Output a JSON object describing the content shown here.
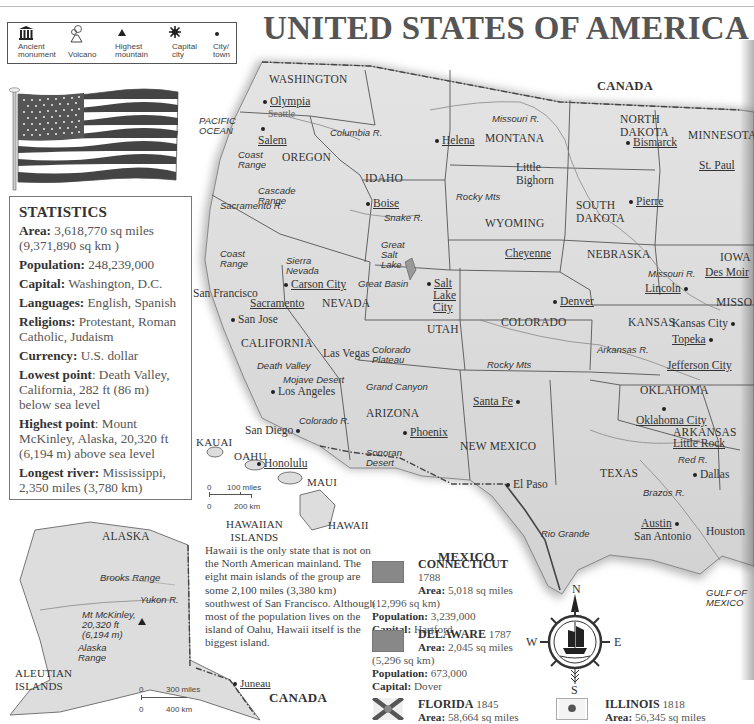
{
  "title": "UNITED STATES OF AMERICA",
  "legend": {
    "items": [
      {
        "icon": "ancient-monument-icon",
        "label": "Ancient monument"
      },
      {
        "icon": "volcano-icon",
        "label": "Volcano"
      },
      {
        "icon": "highest-mountain-icon",
        "label": "Highest mountain"
      },
      {
        "icon": "capital-city-icon",
        "label": "Capital city"
      },
      {
        "icon": "city-town-icon",
        "label": "City/ town"
      }
    ],
    "labels": {
      "monument_1": "Ancient",
      "monument_2": "monument",
      "volcano": "Volcano",
      "mountain_1": "Highest",
      "mountain_2": "mountain",
      "capital_1": "Capital",
      "capital_2": "city",
      "city_1": "City/",
      "city_2": "town"
    }
  },
  "statistics": {
    "heading": "STATISTICS",
    "area_label": "Area:",
    "area_value": "3,618,770 sq miles (9,371,890 sq km )",
    "population_label": "Population:",
    "population_value": "248,239,000",
    "capital_label": "Capital:",
    "capital_value": "Washington, D.C.",
    "languages_label": "Languages:",
    "languages_value": "English, Spanish",
    "religions_label": "Religions:",
    "religions_value": "Protestant, Roman Catholic, Judaism",
    "currency_label": "Currency:",
    "currency_value": "U.S. dollar",
    "lowest_label": "Lowest point",
    "lowest_value": ": Death Valley, California, 282 ft (86 m) below sea level",
    "highest_label": "Highest point",
    "highest_value": ": Mount McKinley, Alaska, 20,320 ft (6,194 m) above sea level",
    "river_label": "Longest river:",
    "river_value": "Mississippi, 2,350 miles (3,780 km)"
  },
  "map": {
    "countries": {
      "canada_north": "CANADA",
      "mexico": "MEXICO",
      "canada_alaska": "CANADA"
    },
    "oceans": {
      "pacific_1": "PACIFIC",
      "pacific_2": "OCEAN",
      "gulf": "GULF OF MEXICO"
    },
    "states": {
      "washington": "WASHINGTON",
      "oregon": "OREGON",
      "idaho": "IDAHO",
      "montana": "MONTANA",
      "wyoming": "WYOMING",
      "north_dakota_1": "NORTH",
      "north_dakota_2": "DAKOTA",
      "south_dakota_1": "SOUTH",
      "south_dakota_2": "DAKOTA",
      "minnesota": "MINNESOTA",
      "nebraska": "NEBRASKA",
      "iowa": "IOWA",
      "missouri": "MISSO",
      "california": "CALIFORNIA",
      "nevada": "NEVADA",
      "utah": "UTAH",
      "colorado": "COLORADO",
      "kansas": "KANSAS",
      "arizona": "ARIZONA",
      "new_mexico": "NEW MEXICO",
      "oklahoma": "OKLAHOMA",
      "arkansas": "ARKANSAS",
      "texas": "TEXAS",
      "alaska": "ALASKA"
    },
    "capitals": {
      "olympia": "Olympia",
      "salem": "Salem",
      "helena": "Helena",
      "boise": "Boise",
      "bismarck": "Bismarck",
      "pierre": "Pierre",
      "st_paul": "St. Paul",
      "cheyenne": "Cheyenne",
      "des_moines": "Des Moir",
      "lincoln": "Lincoln",
      "carson_city": "Carson City",
      "sacramento": "Sacramento",
      "salt_lake_1": "Salt",
      "salt_lake_2": "Lake",
      "salt_lake_3": "City",
      "denver": "Denver",
      "topeka": "Topeka",
      "jefferson_city": "Jefferson City",
      "santa_fe": "Santa Fe",
      "phoenix": "Phoenix",
      "oklahoma_city": "Oklahoma City",
      "little_rock": "Little Rock",
      "austin": "Austin",
      "honolulu": "Honolulu",
      "juneau": "Juneau"
    },
    "cities": {
      "seattle": "Seattle",
      "san_francisco": "San Francisco",
      "san_jose": "San Jose",
      "las_vegas": "Las Vegas",
      "los_angeles": "Los Angeles",
      "san_diego": "San Diego",
      "kansas_city": "Kansas City",
      "dallas": "Dallas",
      "el_paso": "El Paso",
      "san_antonio": "San Antonio",
      "houston": "Houston",
      "little_bighorn_1": "Little",
      "little_bighorn_2": "Bighorn"
    },
    "physical": {
      "columbia": "Columbia R.",
      "coast_range_1": "Coast",
      "coast_range_2": "Range",
      "cascade_1": "Cascade",
      "cascade_2": "Range",
      "snake": "Snake R.",
      "missouri_r": "Missouri R.",
      "rocky_mts": "Rocky Mts",
      "sacramento_r": "Sacramento R.",
      "coast2_1": "Coast",
      "coast2_2": "Range",
      "sierra_1": "Sierra",
      "sierra_2": "Nevada",
      "gsl_1": "Great",
      "gsl_2": "Salt",
      "gsl_3": "Lake",
      "great_basin": "Great Basin",
      "death_valley": "Death Valley",
      "mojave": "Mojave Desert",
      "colorado_plateau_1": "Colorado",
      "colorado_plateau_2": "Plateau",
      "grand_canyon": "Grand Canyon",
      "colorado_r": "Colorado R.",
      "sonoran_1": "Sonoran",
      "sonoran_2": "Desert",
      "missouri_r2": "Missouri R.",
      "arkansas_r": "Arkansas R.",
      "rocky_mts2": "Rocky Mts",
      "red_r": "Red R.",
      "brazos_r": "Brazos R.",
      "rio_grande": "Rio Grande",
      "brooks": "Brooks Range",
      "yukon": "Yukon R.",
      "mckinley_1": "Mt McKinley,",
      "mckinley_2": "20,320 ft",
      "mckinley_3": "(6,194 m)",
      "alaska_range_1": "Alaska",
      "alaska_range_2": "Range"
    },
    "islands": {
      "kauai": "KAUAI",
      "oahu": "OAHU",
      "maui": "MAUI",
      "hawaii": "HAWAII",
      "hawaiian_1": "HAWAIIAN",
      "hawaiian_2": "ISLANDS",
      "aleutian_1": "ALEUTIAN",
      "aleutian_2": "ISLANDS"
    },
    "scales": {
      "hawaii": {
        "zero_a": "0",
        "miles": "100 miles",
        "zero_b": "0",
        "km": "200 km"
      },
      "alaska": {
        "zero_a": "0",
        "miles": "300 miles",
        "zero_b": "0",
        "km": "400 km"
      }
    },
    "compass": {
      "n": "N",
      "s": "S",
      "e": "E",
      "w": "W"
    }
  },
  "hawaii_note": "Hawaii is the only state that is not on the North American mainland. The eight main islands of the group are some 2,100 miles (3,380 km) southwest of San Francisco. Although most of the population lives on the island of Oahu, Hawaii itself is the biggest island.",
  "state_entries": [
    {
      "name": "CONNECTICUT",
      "year": "1788",
      "area_label": "Area:",
      "area": "5,018 sq miles",
      "area_km": "(12,996 sq km)",
      "population_label": "Population:",
      "population": "3,239,000",
      "capital_label": "Capital:",
      "capital": "Hartford"
    },
    {
      "name": "DELAWARE",
      "year": "1787",
      "area_label": "Area:",
      "area": "2,045 sq miles",
      "area_km": "(5,296 sq km)",
      "population_label": "Population:",
      "population": "673,000",
      "capital_label": "Capital:",
      "capital": "Dover"
    },
    {
      "name": "FLORIDA",
      "year": "1845",
      "area_label": "Area:",
      "area": "58,664 sq miles"
    },
    {
      "name": "ILLINOIS",
      "year": "1818",
      "area_label": "Area:",
      "area": "56,345 sq miles"
    }
  ],
  "colors": {
    "ink": "#333333",
    "map_shade": "#cfcfcf",
    "border": "#555555"
  }
}
